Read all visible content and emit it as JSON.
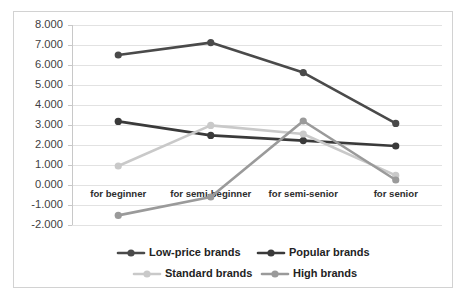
{
  "chart_data": {
    "type": "line",
    "title": "",
    "xlabel": "",
    "ylabel": "",
    "categories": [
      "for beginner",
      "for semi-beginner",
      "for semi-senior",
      "for senior"
    ],
    "ylim": [
      -2.0,
      8.0
    ],
    "ytick_values": [
      8.0,
      7.0,
      6.0,
      5.0,
      4.0,
      3.0,
      2.0,
      1.0,
      0.0,
      -1.0,
      -2.0
    ],
    "ytick_labels": [
      "8.000",
      "7.000",
      "6.000",
      "5.000",
      "4.000",
      "3.000",
      "2.000",
      "1.000",
      "0.000",
      "-1.000",
      "-2.000"
    ],
    "grid": true,
    "legend_position": "bottom",
    "series": [
      {
        "name": "Low-price brands",
        "color": "#4a4a4a",
        "values": [
          6.5,
          7.12,
          5.62,
          3.08
        ]
      },
      {
        "name": "Popular brands",
        "color": "#3a3a3a",
        "values": [
          3.18,
          2.48,
          2.22,
          1.95
        ]
      },
      {
        "name": "Standard brands",
        "color": "#c9c9c9",
        "values": [
          0.95,
          2.98,
          2.55,
          0.48
        ]
      },
      {
        "name": "High brands",
        "color": "#9a9a9a",
        "values": [
          -1.52,
          -0.6,
          3.2,
          0.25
        ]
      }
    ]
  },
  "legend": {
    "entries": [
      {
        "label": "Low-price brands"
      },
      {
        "label": "Popular brands"
      },
      {
        "label": "Standard brands"
      },
      {
        "label": "High brands"
      }
    ]
  }
}
